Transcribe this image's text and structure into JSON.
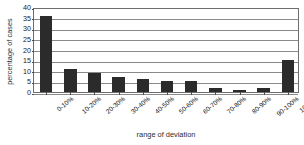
{
  "chart_data": {
    "type": "bar",
    "title": "",
    "xlabel": "range of deviation",
    "ylabel": "percentage of cases",
    "categories": [
      "0-10%",
      "10-20%",
      "20-30%",
      "30-40%",
      "40-50%",
      "50-60%",
      "60-70%",
      "70-80%",
      "80-90%",
      "90-100%",
      "100%+"
    ],
    "values": [
      36,
      11,
      9,
      7,
      6,
      5,
      5,
      2,
      1,
      2,
      15
    ],
    "ylim": [
      0,
      40
    ],
    "ytick_values": [
      0,
      5,
      10,
      15,
      20,
      25,
      30,
      35,
      40
    ],
    "ytick_labels": [
      "0",
      "5",
      "10",
      "15",
      "20",
      "25",
      "30",
      "35",
      "40"
    ],
    "grid": true,
    "grid_axis": "y",
    "legend": false,
    "bar_color": "#2b2b2b",
    "grid_color": "#8a8a8a",
    "axis_color": "#6e6e6e",
    "background_color": "#ffffff"
  }
}
